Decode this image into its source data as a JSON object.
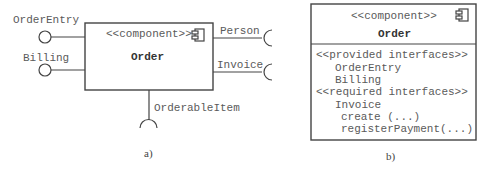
{
  "diagram_a": {
    "stereotype": "<<component>>",
    "name": "Order",
    "provided_interfaces": [
      "OrderEntry",
      "Billing"
    ],
    "required_interfaces_right": [
      "Person",
      "Invoice"
    ],
    "required_interface_bottom": "OrderableItem",
    "caption": "a)"
  },
  "diagram_b": {
    "stereotype": "<<component>>",
    "name": "Order",
    "provided_header": "<<provided interfaces>>",
    "provided": [
      "OrderEntry",
      "Billing"
    ],
    "required_header": "<<required interfaces>>",
    "required": [
      "Invoice"
    ],
    "operations": [
      "create (...)",
      "registerPayment(...)"
    ],
    "caption": "b)"
  }
}
